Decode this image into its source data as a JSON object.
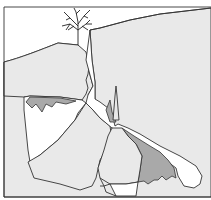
{
  "figure": {
    "title": "",
    "colors": {
      "background": "#ffffff",
      "light_region": "#e9e9e9",
      "dark_region": "#a9a9a9",
      "outline": "#333333"
    }
  }
}
